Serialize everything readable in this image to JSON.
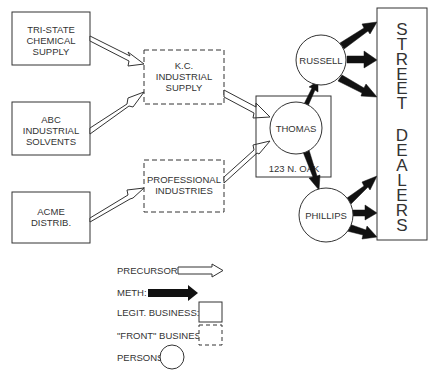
{
  "diagram": {
    "type": "flow",
    "suppliers": [
      {
        "id": "tri-state",
        "lines": [
          "TRI-STATE",
          "CHEMICAL",
          "SUPPLY"
        ],
        "kind": "legit"
      },
      {
        "id": "abc",
        "lines": [
          "ABC",
          "INDUSTRIAL",
          "SOLVENTS"
        ],
        "kind": "legit"
      },
      {
        "id": "acme",
        "lines": [
          "ACME",
          "DISTRIB."
        ],
        "kind": "legit"
      }
    ],
    "fronts": [
      {
        "id": "kc",
        "lines": [
          "K.C.",
          "INDUSTRIAL",
          "SUPPLY"
        ],
        "kind": "front"
      },
      {
        "id": "professional",
        "lines": [
          "PROFESSIONAL",
          "INDUSTRIES"
        ],
        "kind": "front"
      }
    ],
    "hub": {
      "business_label": "123 N. OAK",
      "person": "THOMAS"
    },
    "persons": [
      {
        "id": "russell",
        "label": "RUSSELL"
      },
      {
        "id": "phillips",
        "label": "PHILLIPS"
      }
    ],
    "destination": {
      "letters": [
        "S",
        "T",
        "R",
        "E",
        "E",
        "T",
        "",
        "D",
        "E",
        "A",
        "L",
        "E",
        "R",
        "S"
      ],
      "label": "STREET DEALERS"
    },
    "edges": [
      {
        "from": "TRI-STATE CHEMICAL SUPPLY",
        "to": "K.C. INDUSTRIAL SUPPLY",
        "type": "precursors"
      },
      {
        "from": "ABC INDUSTRIAL SOLVENTS",
        "to": "K.C. INDUSTRIAL SUPPLY",
        "type": "precursors"
      },
      {
        "from": "ACME DISTRIB.",
        "to": "PROFESSIONAL INDUSTRIES",
        "type": "precursors"
      },
      {
        "from": "K.C. INDUSTRIAL SUPPLY",
        "to": "THOMAS",
        "type": "precursors"
      },
      {
        "from": "PROFESSIONAL INDUSTRIES",
        "to": "THOMAS",
        "type": "precursors"
      },
      {
        "from": "THOMAS",
        "to": "RUSSELL",
        "type": "meth"
      },
      {
        "from": "THOMAS",
        "to": "PHILLIPS",
        "type": "meth"
      },
      {
        "from": "RUSSELL",
        "to": "STREET DEALERS",
        "type": "meth",
        "count": 3
      },
      {
        "from": "PHILLIPS",
        "to": "STREET DEALERS",
        "type": "meth",
        "count": 3
      }
    ]
  },
  "legend": {
    "precursors": "PRECURSORS:",
    "meth": "METH:",
    "legit": "LEGIT. BUSINESS:",
    "front": "\"FRONT\" BUSINESS:",
    "persons": "PERSONS:"
  },
  "colors": {
    "stroke": "#333333",
    "fill": "#ffffff",
    "meth": "#111111"
  }
}
